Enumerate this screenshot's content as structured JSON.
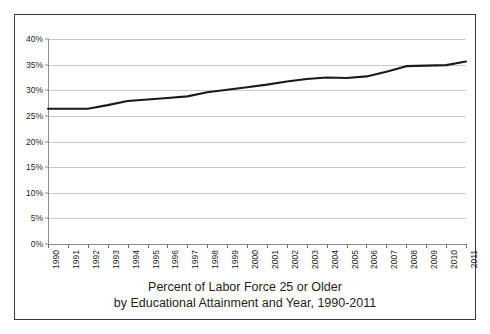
{
  "chart_data": {
    "type": "line",
    "title": "Percent of Labor Force 25 or Older by Educational Attainment and Year, 1990-2011",
    "title_line1": "Percent of Labor Force 25 or Older",
    "title_line2": "by Educational Attainment and Year, 1990-2011",
    "xlabel": "",
    "ylabel": "",
    "x": [
      1990,
      1991,
      1992,
      1993,
      1994,
      1995,
      1996,
      1997,
      1998,
      1999,
      2000,
      2001,
      2002,
      2003,
      2004,
      2005,
      2006,
      2007,
      2008,
      2009,
      2010,
      2011
    ],
    "categories": [
      "1990",
      "1991",
      "1992",
      "1993",
      "1994",
      "1995",
      "1996",
      "1997",
      "1998",
      "1999",
      "2000",
      "2001",
      "2002",
      "2003",
      "2004",
      "2005",
      "2006",
      "2007",
      "2008",
      "2009",
      "2010",
      "2011"
    ],
    "values": [
      26.4,
      26.4,
      26.4,
      27.1,
      27.9,
      28.2,
      28.5,
      28.8,
      29.6,
      30.1,
      30.6,
      31.1,
      31.7,
      32.2,
      32.5,
      32.4,
      32.7,
      33.6,
      34.7,
      34.8,
      34.9,
      35.6
    ],
    "series": [
      {
        "name": "Percent of labor force 25 or older",
        "values": [
          26.4,
          26.4,
          26.4,
          27.1,
          27.9,
          28.2,
          28.5,
          28.8,
          29.6,
          30.1,
          30.6,
          31.1,
          31.7,
          32.2,
          32.5,
          32.4,
          32.7,
          33.6,
          34.7,
          34.8,
          34.9,
          35.6
        ],
        "color": "#1a1a1a"
      }
    ],
    "ylim": [
      0,
      40
    ],
    "xlim": [
      1990,
      2011
    ],
    "yticks": [
      0,
      5,
      10,
      15,
      20,
      25,
      30,
      35,
      40
    ],
    "ytick_labels": [
      "0%",
      "5%",
      "10%",
      "15%",
      "20%",
      "25%",
      "30%",
      "35%",
      "40%"
    ],
    "grid": true,
    "grid_axis": "y",
    "legend": false,
    "legend_position": "none",
    "line_color": "#1a1a1a",
    "grid_color": "#c9c9c9",
    "axis_color": "#8c8c8c",
    "frame_color": "#3a3a3a",
    "background": "#ffffff",
    "xtick_label_rotation": -90
  }
}
